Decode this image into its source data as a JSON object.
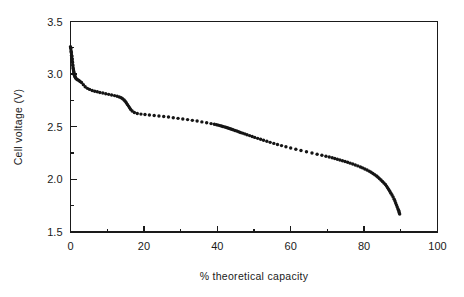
{
  "chart_data": {
    "type": "scatter",
    "title": "",
    "subtitle": "",
    "xlabel": "% theoretical capacity",
    "ylabel": "Cell voltage (V)",
    "xlim": [
      0,
      100
    ],
    "ylim": [
      1.5,
      3.5
    ],
    "x_major_ticks": [
      0,
      20,
      40,
      60,
      80,
      100
    ],
    "x_major_tick_labels": [
      "0",
      "20",
      "40",
      "60",
      "80",
      "100"
    ],
    "x_minor_ticks": [
      10,
      30,
      50,
      70,
      90
    ],
    "y_major_ticks": [
      1.5,
      2.0,
      2.5,
      3.0,
      3.5
    ],
    "y_major_tick_labels": [
      "1.5",
      "2.0",
      "2.5",
      "3.0",
      "3.5"
    ],
    "y_minor_ticks": [
      1.75,
      2.25,
      2.75,
      3.25
    ],
    "grid": false,
    "legend": null,
    "legend_position": "none",
    "marker": "dot",
    "marker_color": "#151515",
    "marker_size": 1.7,
    "series": [
      {
        "name": "discharge curve",
        "x": [
          0.0,
          0.05,
          0.1,
          0.15,
          0.2,
          0.25,
          0.3,
          0.35,
          0.4,
          0.45,
          0.5,
          0.55,
          0.6,
          0.65,
          0.7,
          0.75,
          0.8,
          0.85,
          0.9,
          0.95,
          1.0,
          1.1,
          1.2,
          1.3,
          1.45,
          1.6,
          1.8,
          2.0,
          2.3,
          2.6,
          3.0,
          3.5,
          4.0,
          4.6,
          5.2,
          5.9,
          6.6,
          7.3,
          8.0,
          8.8,
          9.6,
          10.4,
          11.2,
          12.0,
          12.7,
          13.3,
          13.8,
          14.2,
          14.6,
          14.9,
          15.2,
          15.5,
          15.8,
          16.1,
          16.4,
          16.8,
          17.4,
          18.2,
          19.2,
          20.3,
          21.5,
          22.8,
          24.1,
          25.4,
          26.7,
          28.0,
          29.3,
          30.6,
          31.9,
          33.2,
          34.5,
          35.8,
          37.1,
          38.3,
          39.2,
          39.8,
          40.3,
          40.7,
          41.1,
          41.5,
          41.9,
          42.3,
          42.7,
          43.1,
          43.5,
          43.9,
          44.3,
          44.8,
          45.3,
          45.8,
          46.3,
          46.9,
          47.5,
          48.1,
          48.8,
          49.5,
          50.2,
          51.0,
          51.8,
          52.6,
          53.5,
          54.4,
          55.4,
          56.4,
          57.5,
          58.7,
          60.0,
          61.4,
          62.8,
          64.3,
          65.8,
          67.2,
          68.5,
          69.6,
          70.5,
          71.3,
          72.0,
          72.7,
          73.4,
          74.1,
          74.8,
          75.5,
          76.2,
          76.9,
          77.6,
          78.3,
          79.0,
          79.6,
          80.2,
          80.8,
          81.4,
          81.9,
          82.4,
          82.9,
          83.4,
          83.8,
          84.2,
          84.6,
          85.0,
          85.4,
          85.8,
          86.1,
          86.4,
          86.7,
          87.0,
          87.3,
          87.6,
          87.9,
          88.2,
          88.4,
          88.6,
          88.8,
          89.0,
          89.2,
          89.4,
          89.5,
          89.6,
          89.7
        ],
        "y": [
          3.26,
          3.25,
          3.24,
          3.22,
          3.21,
          3.2,
          3.18,
          3.17,
          3.15,
          3.14,
          3.12,
          3.11,
          3.09,
          3.08,
          3.06,
          3.05,
          3.04,
          3.03,
          3.02,
          3.01,
          3.0,
          2.99,
          2.98,
          2.97,
          2.96,
          2.955,
          2.95,
          2.945,
          2.94,
          2.93,
          2.92,
          2.9,
          2.88,
          2.865,
          2.855,
          2.845,
          2.838,
          2.832,
          2.826,
          2.82,
          2.814,
          2.808,
          2.802,
          2.796,
          2.79,
          2.783,
          2.775,
          2.766,
          2.755,
          2.742,
          2.728,
          2.712,
          2.696,
          2.68,
          2.665,
          2.65,
          2.636,
          2.626,
          2.62,
          2.616,
          2.612,
          2.607,
          2.602,
          2.597,
          2.592,
          2.586,
          2.58,
          2.574,
          2.568,
          2.561,
          2.554,
          2.546,
          2.538,
          2.53,
          2.524,
          2.519,
          2.515,
          2.511,
          2.507,
          2.503,
          2.499,
          2.495,
          2.49,
          2.486,
          2.481,
          2.476,
          2.471,
          2.465,
          2.459,
          2.453,
          2.446,
          2.439,
          2.432,
          2.424,
          2.416,
          2.408,
          2.399,
          2.39,
          2.381,
          2.372,
          2.362,
          2.352,
          2.342,
          2.332,
          2.321,
          2.31,
          2.298,
          2.286,
          2.274,
          2.262,
          2.25,
          2.239,
          2.229,
          2.22,
          2.212,
          2.205,
          2.198,
          2.191,
          2.184,
          2.177,
          2.17,
          2.162,
          2.154,
          2.146,
          2.137,
          2.128,
          2.118,
          2.109,
          2.099,
          2.089,
          2.078,
          2.067,
          2.056,
          2.044,
          2.032,
          2.02,
          2.007,
          1.994,
          1.98,
          1.966,
          1.951,
          1.936,
          1.92,
          1.904,
          1.887,
          1.869,
          1.851,
          1.832,
          1.812,
          1.794,
          1.776,
          1.758,
          1.74,
          1.722,
          1.706,
          1.692,
          1.68,
          1.67
        ]
      }
    ]
  },
  "axes": {
    "x_axis_name": "x-axis",
    "y_axis_name": "y-axis"
  }
}
